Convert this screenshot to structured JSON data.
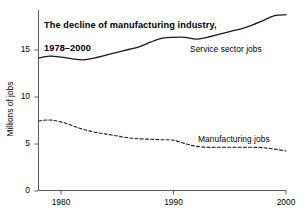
{
  "chart_data": {
    "type": "line",
    "title": "The decline of manufacturing industry,\n1978–2000",
    "title_line1": "The decline of manufacturing industry,",
    "title_line2": "1978–2000",
    "xlabel": "",
    "ylabel": "Millions of jobs",
    "xlim": [
      1978,
      2000
    ],
    "ylim": [
      0,
      19.2
    ],
    "grid": false,
    "legend_position": "inline-annotations",
    "xticks": [
      1980,
      1990,
      2000
    ],
    "xtick_labels": [
      "1980",
      "1990",
      "2000"
    ],
    "yticks": [
      0,
      5,
      10,
      15
    ],
    "ytick_labels": [
      "0",
      "5",
      "10",
      "15"
    ],
    "x": [
      1978,
      1979,
      1980,
      1981,
      1982,
      1983,
      1984,
      1985,
      1986,
      1987,
      1988,
      1989,
      1990,
      1991,
      1992,
      1993,
      1994,
      1995,
      1996,
      1997,
      1998,
      1999,
      2000
    ],
    "series": [
      {
        "name": "Service sector jobs",
        "style": "solid",
        "color": "#1a1a1a",
        "annotation": "Service sector jobs",
        "values": [
          14.1,
          14.3,
          14.2,
          14.0,
          13.9,
          14.1,
          14.4,
          14.7,
          15.0,
          15.3,
          15.8,
          16.2,
          16.3,
          16.3,
          16.1,
          16.3,
          16.6,
          16.9,
          17.2,
          17.6,
          18.1,
          18.6,
          18.7
        ]
      },
      {
        "name": "Manufacturing jobs",
        "style": "dashed",
        "color": "#1a1a1a",
        "annotation": "Manufacturing jobs",
        "values": [
          7.4,
          7.5,
          7.3,
          6.9,
          6.5,
          6.2,
          6.0,
          5.8,
          5.6,
          5.5,
          5.45,
          5.4,
          5.35,
          5.0,
          4.7,
          4.6,
          4.6,
          4.6,
          4.6,
          4.6,
          4.55,
          4.4,
          4.2
        ]
      }
    ]
  },
  "axes": {
    "y_title": "Millions of jobs"
  }
}
